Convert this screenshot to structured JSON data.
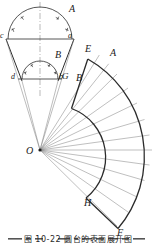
{
  "figure": {
    "title_caption": "图 10-22  圆台的表面展开图",
    "stroke_color": "#2b2b2b",
    "thin_color": "#6e6e6e",
    "background": "#ffffff"
  },
  "front_view": {
    "labels": {
      "top_arc": "A",
      "mid_arc": "B",
      "top_left": "c",
      "top_right": "a",
      "bottom_left": "d",
      "bottom_right": "b"
    },
    "divisions": 6
  },
  "development": {
    "apex_label": "O",
    "labels": {
      "outer_start": "E",
      "outer_start_ray": "A",
      "inner_start": "G",
      "inner_start_ray": "B",
      "inner_end": "H",
      "outer_end": "F"
    },
    "divisions": 12,
    "inner_radius": 52,
    "outer_radius": 112,
    "start_angle_deg": -58,
    "end_angle_deg": 58
  }
}
